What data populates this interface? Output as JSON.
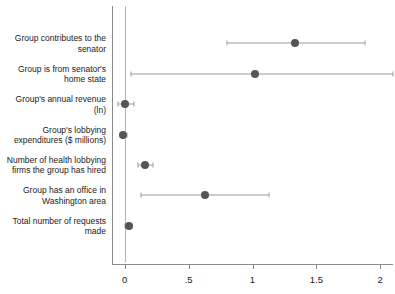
{
  "chart_data": {
    "type": "scatter",
    "subtype": "coefficient-plot",
    "title": "",
    "subtitle": "",
    "xlabel": "",
    "ylabel": "",
    "xlim": [
      -0.1,
      2.1
    ],
    "xticks": [
      0,
      0.5,
      1,
      1.5,
      2
    ],
    "xtick_labels": [
      "0",
      ".5",
      "1",
      "1.5",
      "2"
    ],
    "grid": false,
    "legend": null,
    "reference_line": 0,
    "marker_color": "#555555",
    "ci_color": "#9a9a9a",
    "axis_color": "#8a8a8a",
    "categories": [
      "Group contributes to the\nsenator",
      "Group is from senator's\nhome state",
      "Group's annual revenue\n(ln)",
      "Group's lobbying\nexpenditures ($ millions)",
      "Number of health lobbying\nfirms the group has hired",
      "Group has an office in\nWashington area",
      "Total number of requests\nmade"
    ],
    "values": [
      1.33,
      1.02,
      0.0,
      -0.01,
      0.16,
      0.63,
      0.03
    ],
    "ci_low": [
      0.8,
      0.05,
      -0.05,
      -0.03,
      0.1,
      0.13,
      0.0
    ],
    "ci_high": [
      1.88,
      2.1,
      0.07,
      0.02,
      0.22,
      1.13,
      0.06
    ]
  }
}
